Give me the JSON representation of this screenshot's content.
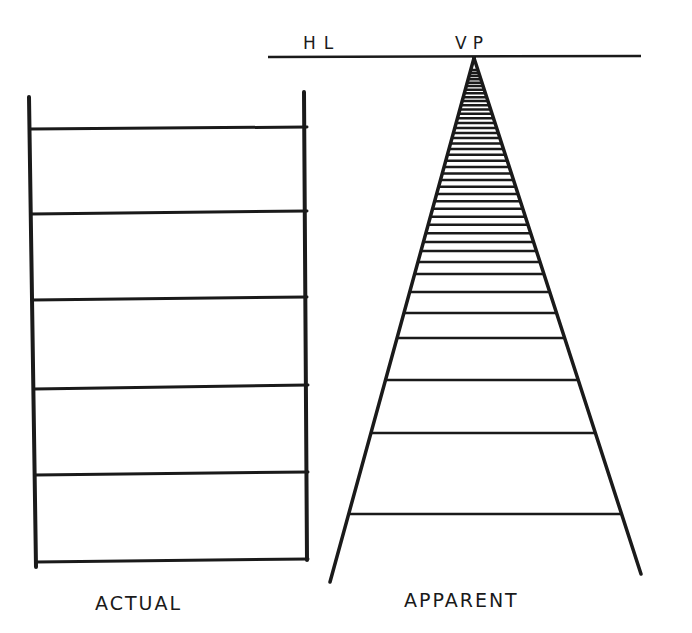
{
  "labels": {
    "horizon_line": "HL",
    "vanishing_point": "VP",
    "actual": "ACTUAL",
    "apparent": "APPARENT"
  },
  "actual_ladder": {
    "rung_count": 6
  },
  "apparent_ladder": {
    "converges_to": "vanishing point on horizon line"
  },
  "colors": {
    "ink": "#1a1a1a",
    "paper": "#ffffff"
  }
}
